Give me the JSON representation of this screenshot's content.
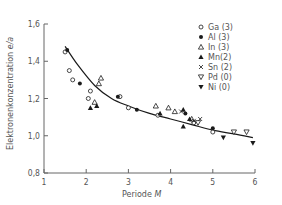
{
  "chart_data": {
    "type": "scatter",
    "title": "",
    "xlabel": "Periode M",
    "ylabel": "Elektronenkonzentration e/a",
    "xlim": [
      1,
      6
    ],
    "ylim": [
      0.8,
      1.6
    ],
    "xticks": [
      1,
      2,
      3,
      4,
      5,
      6
    ],
    "xtick_labels": [
      "1",
      "2",
      "3",
      "4",
      "5",
      "6"
    ],
    "yticks": [
      0.8,
      1.0,
      1.2,
      1.4,
      1.6
    ],
    "ytick_labels": [
      "0,8",
      "1,0",
      "1,2",
      "1,4",
      "1,6"
    ],
    "grid": false,
    "legend_position": "upper right",
    "series": [
      {
        "name": "Ga (3)",
        "marker": "open-circle",
        "points": [
          [
            1.5,
            1.45
          ],
          [
            1.6,
            1.35
          ],
          [
            1.68,
            1.3
          ],
          [
            2.1,
            1.24
          ],
          [
            2.05,
            1.2
          ],
          [
            2.8,
            1.21
          ],
          [
            3.0,
            1.15
          ],
          [
            3.7,
            1.11
          ],
          [
            4.55,
            1.07
          ],
          [
            5.0,
            1.02
          ]
        ]
      },
      {
        "name": "Al (3)",
        "marker": "filled-circle",
        "points": [
          [
            1.55,
            1.46
          ],
          [
            1.85,
            1.28
          ],
          [
            2.75,
            1.21
          ],
          [
            3.2,
            1.14
          ],
          [
            4.35,
            1.12
          ],
          [
            5.0,
            1.04
          ]
        ]
      },
      {
        "name": "In (3)",
        "marker": "open-triangle-up",
        "points": [
          [
            2.3,
            1.28
          ],
          [
            2.35,
            1.31
          ],
          [
            2.2,
            1.18
          ],
          [
            3.65,
            1.16
          ],
          [
            3.95,
            1.15
          ],
          [
            4.1,
            1.13
          ],
          [
            4.5,
            1.09
          ]
        ]
      },
      {
        "name": "Mn (2)",
        "marker": "filled-triangle-up",
        "points": [
          [
            2.1,
            1.15
          ],
          [
            2.25,
            1.16
          ],
          [
            3.75,
            1.12
          ],
          [
            4.3,
            1.14
          ],
          [
            4.45,
            1.09
          ],
          [
            4.3,
            1.05
          ]
        ]
      },
      {
        "name": "Sn (2)",
        "marker": "cross",
        "points": [
          [
            4.25,
            1.13
          ],
          [
            4.55,
            1.08
          ],
          [
            4.7,
            1.09
          ]
        ]
      },
      {
        "name": "Pd (0)",
        "marker": "open-triangle-down",
        "points": [
          [
            4.65,
            1.07
          ],
          [
            5.5,
            1.02
          ],
          [
            5.8,
            1.02
          ]
        ]
      },
      {
        "name": "Ni (0)",
        "marker": "filled-triangle-down",
        "points": [
          [
            5.25,
            0.99
          ],
          [
            5.95,
            0.96
          ]
        ]
      }
    ],
    "fit_curve": {
      "description": "decreasing hyperbolic fit",
      "points": [
        [
          1.5,
          1.48
        ],
        [
          1.8,
          1.38
        ],
        [
          2.2,
          1.27
        ],
        [
          2.6,
          1.2
        ],
        [
          3.0,
          1.16
        ],
        [
          3.5,
          1.12
        ],
        [
          4.0,
          1.09
        ],
        [
          4.5,
          1.06
        ],
        [
          5.0,
          1.03
        ],
        [
          5.5,
          1.01
        ],
        [
          5.95,
          0.99
        ]
      ]
    }
  },
  "axis": {
    "x_title_prefix": "Periode ",
    "x_title_var": "M",
    "y_title_prefix": "Elektronenkonzentration ",
    "y_title_var": "e/a"
  },
  "legend": [
    {
      "label": "Ga (3)",
      "marker": "open-circle"
    },
    {
      "label": "Al (3)",
      "marker": "filled-circle"
    },
    {
      "label": "In (3)",
      "marker": "open-triangle-up"
    },
    {
      "label": "Mn(2)",
      "marker": "filled-triangle-up"
    },
    {
      "label": "Sn (2)",
      "marker": "cross"
    },
    {
      "label": "Pd (0)",
      "marker": "open-triangle-down"
    },
    {
      "label": "Ni (0)",
      "marker": "filled-triangle-down"
    }
  ],
  "colors": {
    "ink": "#1a1a1a",
    "text": "#555555",
    "axis": "#666666"
  }
}
